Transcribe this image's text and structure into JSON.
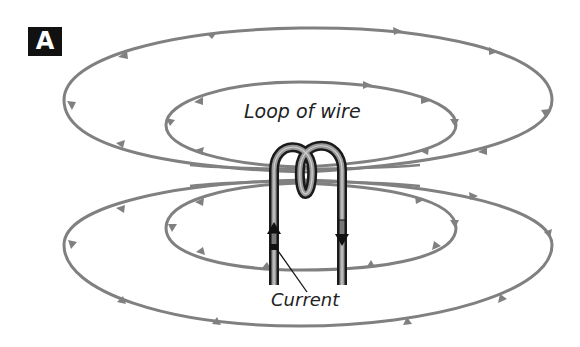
{
  "figure": {
    "panel_label": "A",
    "labels": {
      "loop": "Loop of wire",
      "current": "Current"
    },
    "colors": {
      "field_line": "#808080",
      "wire_outline": "#1a1a1a",
      "wire_fill": "#9a9a9a",
      "badge_bg": "#111111",
      "badge_text": "#ffffff",
      "text": "#222222"
    },
    "elements": {
      "field_lines": [
        {
          "id": "outer-top",
          "direction": "clockwise"
        },
        {
          "id": "inner-top",
          "direction": "clockwise"
        },
        {
          "id": "inner-bottom",
          "direction": "counterclockwise"
        },
        {
          "id": "outer-bottom",
          "direction": "counterclockwise"
        }
      ],
      "current_arrows": [
        {
          "wire": "left",
          "direction": "up"
        },
        {
          "wire": "right",
          "direction": "down"
        }
      ]
    }
  }
}
